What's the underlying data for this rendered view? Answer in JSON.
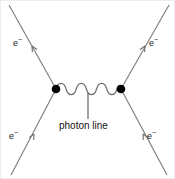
{
  "figure": {
    "type": "feynman-diagram",
    "title": "",
    "background_color": "#ffffff",
    "line_color": "#7a7a7a",
    "vertex_color": "#000000",
    "text_color": "#111111"
  },
  "labels": {
    "electron_upper_left": "e−",
    "electron_upper_right": "e−",
    "electron_lower_left": "e−",
    "electron_lower_right": "e−",
    "photon": "photon line"
  },
  "electron_symbol": {
    "base": "e",
    "superscript": "−"
  },
  "vertices": [
    {
      "name": "left-vertex",
      "x": 55,
      "y": 88
    },
    {
      "name": "right-vertex",
      "x": 120,
      "y": 88
    }
  ],
  "fermion_lines": [
    {
      "name": "incoming-electron-lower-left",
      "x1": 10,
      "y1": 174,
      "x2": 55,
      "y2": 88,
      "arrow_direction": "up-right"
    },
    {
      "name": "outgoing-electron-upper-left",
      "x1": 55,
      "y1": 88,
      "x2": 8,
      "y2": 4,
      "arrow_direction": "up-left"
    },
    {
      "name": "incoming-electron-lower-right",
      "x1": 166,
      "y1": 174,
      "x2": 120,
      "y2": 88,
      "arrow_direction": "up-left"
    },
    {
      "name": "outgoing-electron-upper-right",
      "x1": 120,
      "y1": 88,
      "x2": 168,
      "y2": 4,
      "arrow_direction": "up-right"
    }
  ],
  "photon_line": {
    "name": "photon-propagator",
    "x1": 55,
    "y1": 88,
    "x2": 120,
    "y2": 88,
    "wave_count": 4,
    "amplitude": 6
  },
  "leader_line": {
    "name": "photon-label-leader",
    "x": 87,
    "y1": 92,
    "y2": 118
  }
}
